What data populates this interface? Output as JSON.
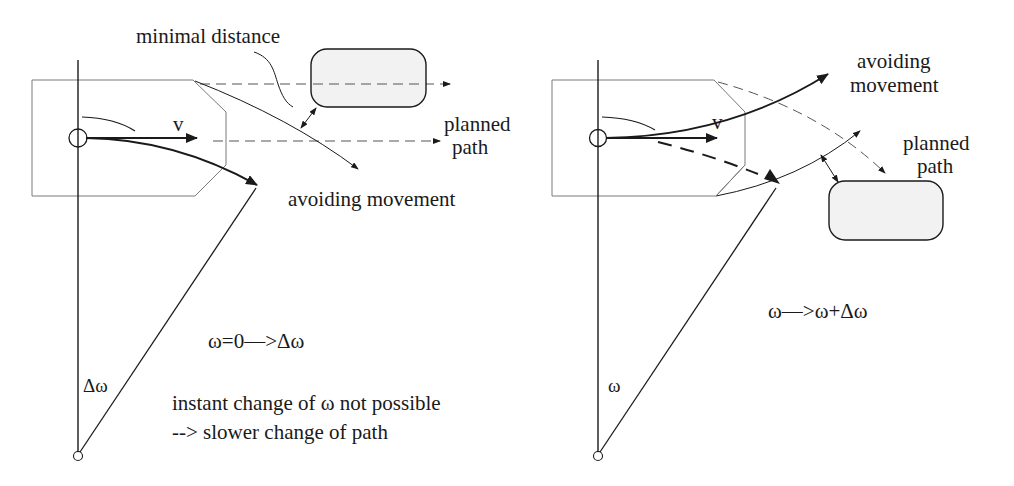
{
  "colors": {
    "ink": "#1a1a1a",
    "thin_line": "#6a6a6a",
    "obstacle_fill": "#f2f2f2",
    "background": "#ffffff"
  },
  "left_panel": {
    "velocity_label": "v",
    "minimal_distance_label": "minimal distance",
    "planned_path_label_line1": "planned",
    "planned_path_label_line2": "path",
    "avoiding_movement_label": "avoiding movement",
    "angle_label": "Δω",
    "equation": "ω=0—>Δω",
    "note_line1": "instant change of ω not possible",
    "note_line2": "--> slower change of path"
  },
  "right_panel": {
    "velocity_label": "v",
    "avoiding_movement_label_line1": "avoiding",
    "avoiding_movement_label_line2": "movement",
    "planned_path_label_line1": "planned",
    "planned_path_label_line2": "path",
    "angle_label": "ω",
    "equation": "ω—>ω+Δω"
  }
}
